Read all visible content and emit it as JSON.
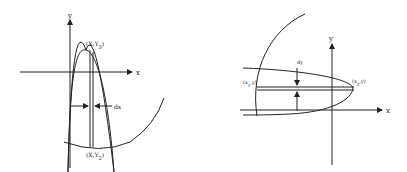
{
  "left_diagram": {
    "y_axis_label": "y",
    "x_axis_label": "x",
    "top_point_label": "(X,Y",
    "top_point_sub": "3",
    "bottom_point_label": "(X,Y",
    "bottom_point_sub": "2",
    "width_label": "dx",
    "close_paren": ")"
  },
  "right_diagram": {
    "y_axis_label": "y",
    "x_axis_label": "x",
    "left_point_label": "(x",
    "left_point_sub": "1",
    "left_point_tail": ",y)",
    "right_point_label": "(x",
    "right_point_sub": "2",
    "right_point_tail": ",y)",
    "height_label": "dy"
  }
}
